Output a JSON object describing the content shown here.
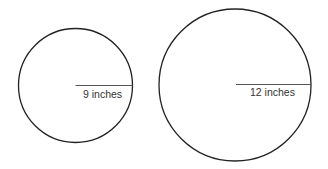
{
  "diagram": {
    "circles": [
      {
        "id": "small",
        "radius_label": "9 inches",
        "cx": 75.5,
        "cy": 85.5,
        "r": 57
      },
      {
        "id": "large",
        "radius_label": "12 inches",
        "cx": 235,
        "cy": 85,
        "r": 76
      }
    ],
    "colors": {
      "stroke": "#222222",
      "radius_line": "#555555",
      "text": "#333333"
    }
  }
}
